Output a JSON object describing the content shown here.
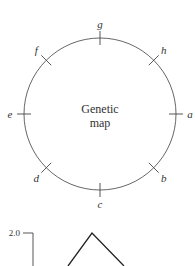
{
  "diagram": {
    "center_label_line1": "Genetic",
    "center_label_line2": "map",
    "markers": [
      {
        "label": "g",
        "angle_deg": 90
      },
      {
        "label": "h",
        "angle_deg": 45
      },
      {
        "label": "a",
        "angle_deg": 0
      },
      {
        "label": "b",
        "angle_deg": -45
      },
      {
        "label": "c",
        "angle_deg": -90
      },
      {
        "label": "d",
        "angle_deg": -135
      },
      {
        "label": "e",
        "angle_deg": 180
      },
      {
        "label": "f",
        "angle_deg": 135
      }
    ]
  },
  "partial_chart": {
    "y_tick_label": "2.0"
  }
}
